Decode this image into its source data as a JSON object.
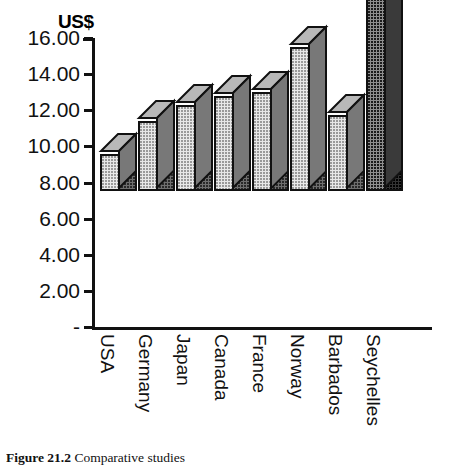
{
  "figure": {
    "axis_title": "US$",
    "caption_label": "Figure 21.2",
    "caption_text": "Comparative studies"
  },
  "chart_data": {
    "type": "bar",
    "title": "",
    "subtitle": "",
    "xlabel": "",
    "ylabel": "US$",
    "categories": [
      "USA",
      "Germany",
      "Japan",
      "Canada",
      "France",
      "Norway",
      "Barbados",
      "Seychelles"
    ],
    "values": [
      2.05,
      3.85,
      4.75,
      5.25,
      5.5,
      8.0,
      4.2,
      14.7
    ],
    "ylim": [
      0,
      16
    ],
    "ytick_values": [
      0,
      2,
      4,
      6,
      8,
      10,
      12,
      14,
      16
    ],
    "ytick_labels": [
      "-",
      "2.00",
      "4.00",
      "6.00",
      "8.00",
      "10.00",
      "12.00",
      "14.00",
      "16.00"
    ],
    "grid": false,
    "legend": null,
    "style": "3d-bar",
    "series": [
      {
        "name": "US$",
        "values": [
          2.05,
          3.85,
          4.75,
          5.25,
          5.5,
          8.0,
          4.2,
          14.7
        ]
      }
    ],
    "bar_colors": {
      "front_light": "#e8e8e8",
      "side_dark": "#6f6f6f",
      "front_highlight": "#8f8f8f",
      "side_darkest": "#333333",
      "outline": "#111111"
    }
  }
}
